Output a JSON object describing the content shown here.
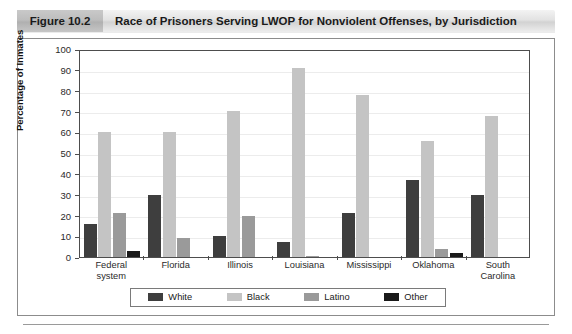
{
  "figure": {
    "number": "Figure 10.2",
    "title": "Race of Prisoners Serving LWOP for Nonviolent Offenses, by Jurisdiction"
  },
  "chart_data": {
    "type": "bar",
    "title": "Race of Prisoners Serving LWOP for Nonviolent Offenses, by Jurisdiction",
    "xlabel": "",
    "ylabel": "Percentage of Inmates",
    "ylim": [
      0,
      100
    ],
    "ytick_labels": [
      "100",
      "90",
      "80",
      "70",
      "60",
      "50",
      "40",
      "30",
      "20",
      "10",
      "0"
    ],
    "ytick_values": [
      100,
      90,
      80,
      70,
      60,
      50,
      40,
      30,
      20,
      10,
      0
    ],
    "grid": true,
    "legend_position": "bottom",
    "categories": [
      "Federal system",
      "Florida",
      "Illinois",
      "Louisiana",
      "Mississippi",
      "Oklahoma",
      "South Carolina"
    ],
    "category_lines": [
      [
        "Federal",
        "system"
      ],
      [
        "Florida"
      ],
      [
        "Illinois"
      ],
      [
        "Louisiana"
      ],
      [
        "Mississippi"
      ],
      [
        "Oklahoma"
      ],
      [
        "South",
        "Carolina"
      ]
    ],
    "series": [
      {
        "name": "White",
        "color": "#3e3e3e",
        "values": [
          16,
          30,
          10,
          7,
          21,
          37,
          30
        ]
      },
      {
        "name": "Black",
        "color": "#c4c4c4",
        "values": [
          60,
          60,
          70,
          91,
          78,
          56,
          68
        ]
      },
      {
        "name": "Latino",
        "color": "#9a9a9a",
        "values": [
          21,
          9,
          19.5,
          0.5,
          0,
          4,
          0
        ]
      },
      {
        "name": "Other",
        "color": "#1a1a1a",
        "values": [
          3,
          0,
          0,
          0,
          0,
          2,
          0
        ]
      }
    ]
  },
  "legend": {
    "items": [
      {
        "label": "White",
        "color": "#3e3e3e"
      },
      {
        "label": "Black",
        "color": "#c4c4c4"
      },
      {
        "label": "Latino",
        "color": "#9a9a9a"
      },
      {
        "label": "Other",
        "color": "#1a1a1a"
      }
    ]
  }
}
